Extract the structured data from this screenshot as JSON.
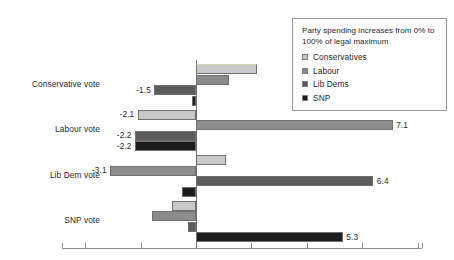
{
  "chart_data": {
    "type": "bar",
    "orientation": "horizontal",
    "title": "",
    "subtitle": "",
    "xlabel": "",
    "ylabel": "",
    "categories": [
      "Conservative vote",
      "Labour vote",
      "Lib Dem vote",
      "SNP vote"
    ],
    "series": [
      {
        "name": "Conservatives",
        "color": "#c9c9c9",
        "values": [
          2.2,
          -2.1,
          1.1,
          -0.85
        ],
        "labels": [
          "",
          "-2.1",
          "",
          ""
        ]
      },
      {
        "name": "Labour",
        "color": "#8c8c8c",
        "values": [
          1.2,
          7.1,
          -3.1,
          -1.6
        ],
        "labels": [
          "",
          "7.1",
          "-3.1",
          ""
        ]
      },
      {
        "name": "Lib Dems",
        "color": "#5c5c5c",
        "values": [
          -1.5,
          -2.2,
          6.4,
          -0.3
        ],
        "labels": [
          "-1.5",
          "-2.2",
          "6.4",
          ""
        ]
      },
      {
        "name": "SNP",
        "color": "#1d1d1d",
        "values": [
          -0.15,
          -2.2,
          -0.5,
          5.3
        ],
        "labels": [
          "",
          "-2.2",
          "",
          "5.3"
        ]
      }
    ],
    "xlim": [
      -4.0,
      8.0
    ],
    "xticks": [
      -4,
      -2,
      0,
      2,
      4,
      6,
      8
    ],
    "xtick_labels": [
      "",
      "",
      "",
      "",
      "",
      "",
      ""
    ],
    "grid": false,
    "legend_position": "top-right",
    "zero_line": 0
  },
  "legend": {
    "title": "Party spending increases from 0% to 100% of legal maximum",
    "entries": [
      {
        "label": "Conservatives",
        "color": "#c9c9c9"
      },
      {
        "label": "Labour",
        "color": "#8c8c8c"
      },
      {
        "label": "Lib Dems",
        "color": "#5c5c5c"
      },
      {
        "label": "SNP",
        "color": "#1d1d1d"
      }
    ]
  }
}
